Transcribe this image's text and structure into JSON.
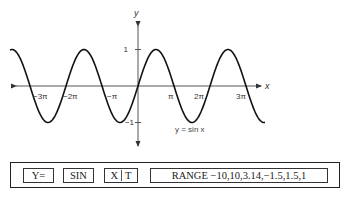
{
  "chart_data": {
    "type": "line",
    "title": "",
    "function": "y = sin x",
    "series": [
      {
        "name": "y = sin x",
        "x_range_radians": [
          -11.17,
          11.08
        ]
      }
    ],
    "xlabel": "x",
    "ylabel": "y",
    "x_ticks": [
      {
        "value": -9.4248,
        "label": "−3π"
      },
      {
        "value": -6.2832,
        "label": "−2π"
      },
      {
        "value": -3.1416,
        "label": "−π"
      },
      {
        "value": 3.1416,
        "label": "π"
      },
      {
        "value": 6.2832,
        "label": "2π"
      },
      {
        "value": 9.4248,
        "label": "3π"
      }
    ],
    "y_ticks": [
      {
        "value": 1,
        "label": "1"
      },
      {
        "value": -1,
        "label": "−1"
      }
    ],
    "ylim": [
      -1.6,
      1.6
    ],
    "grid": false,
    "legend": "none",
    "annotation": "y = sin x"
  },
  "graph": {
    "x_axis_label": "x",
    "y_axis_label": "y",
    "equation_label": "y = sin x",
    "x_tick_labels": [
      "−3π",
      "−2π",
      "−π",
      "π",
      "2π",
      "3π"
    ],
    "y_tick_labels": [
      "1",
      "−1"
    ]
  },
  "keys": {
    "y_equals": "Y=",
    "sin": "SIN",
    "xt_left": "X",
    "xt_right": "T",
    "range": "RANGE −10,10,3.14,−1.5,1.5,1"
  }
}
